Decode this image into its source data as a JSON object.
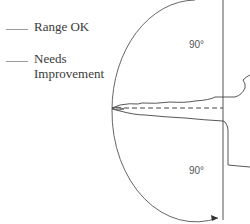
{
  "legend": {
    "items": [
      {
        "label": "Range OK"
      },
      {
        "label": "Needs Improvement"
      }
    ]
  },
  "diagram": {
    "upper_angle_label": "90°",
    "lower_angle_label": "90°"
  }
}
